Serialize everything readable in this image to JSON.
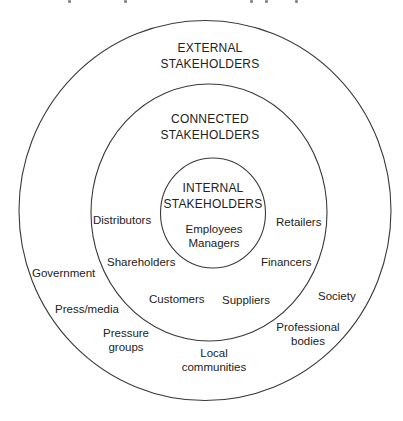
{
  "diagram": {
    "type": "concentric-circles",
    "rings": [
      {
        "id": "external",
        "title_line1": "EXTERNAL",
        "title_line2": "STAKEHOLDERS",
        "members": [
          "Government",
          "Press/media",
          "Pressure groups",
          "Local communities",
          "Professional bodies",
          "Society"
        ]
      },
      {
        "id": "connected",
        "title_line1": "CONNECTED",
        "title_line2": "STAKEHOLDERS",
        "members": [
          "Distributors",
          "Shareholders",
          "Customers",
          "Suppliers",
          "Financers",
          "Retailers"
        ]
      },
      {
        "id": "internal",
        "title_line1": "INTERNAL",
        "title_line2": "STAKEHOLDERS",
        "members": [
          "Employees",
          "Managers"
        ]
      }
    ],
    "labels": {
      "government": "Government",
      "press_media": "Press/media",
      "pressure_groups_1": "Pressure",
      "pressure_groups_2": "groups",
      "local_communities_1": "Local",
      "local_communities_2": "communities",
      "professional_bodies_1": "Professional",
      "professional_bodies_2": "bodies",
      "society": "Society",
      "distributors": "Distributors",
      "shareholders": "Shareholders",
      "customers": "Customers",
      "suppliers": "Suppliers",
      "financers": "Financers",
      "retailers": "Retailers",
      "employees": "Employees",
      "managers": "Managers"
    },
    "colors": {
      "stroke": "#3a3a3a",
      "text": "#222222",
      "background": "#ffffff"
    }
  }
}
